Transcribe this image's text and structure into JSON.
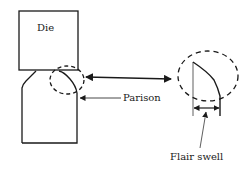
{
  "diagram": {
    "labels": {
      "die": "Die",
      "parison": "Parison",
      "flair_swell": "Flair swell"
    },
    "colors": {
      "stroke": "#1a1a1a",
      "background": "#ffffff"
    }
  }
}
